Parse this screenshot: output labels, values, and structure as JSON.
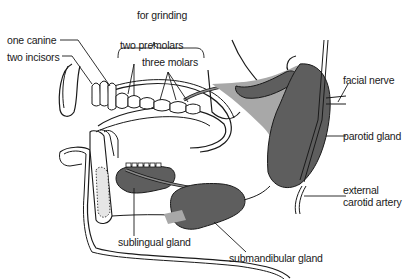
{
  "diagram": {
    "colors": {
      "line": "#1a1a1a",
      "gland_dark": "#5e5e5e",
      "gland_light": "#a8a8a8",
      "background": "#ffffff"
    },
    "labels": {
      "for_grinding": "for grinding",
      "one_canine": "one canine",
      "two_incisors": "two incisors",
      "two_premolars": "two premolars",
      "three_molars": "three molars",
      "facial_nerve": "facial nerve",
      "parotid_gland": "parotid gland",
      "external_carotid_line1": "external",
      "external_carotid_line2": "carotid artery",
      "sublingual_gland": "sublingual gland",
      "submandibular_gland": "submandibular gland"
    }
  }
}
